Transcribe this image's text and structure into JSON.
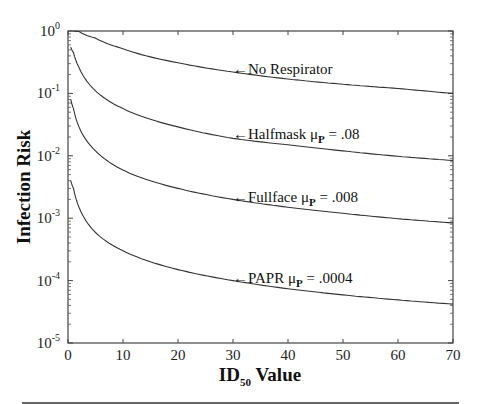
{
  "chart_data": {
    "type": "line",
    "title": "",
    "xlabel": "ID",
    "xlabel_subscript": "50",
    "xlabel_suffix": " Value",
    "ylabel": "Infection Risk",
    "xlim": [
      0,
      70
    ],
    "ylim": [
      1e-05,
      1
    ],
    "yscale": "log",
    "grid": false,
    "x_ticks": [
      0,
      10,
      20,
      30,
      40,
      50,
      60,
      70
    ],
    "y_ticks": [
      {
        "base": "10",
        "exp": "0",
        "value": 1
      },
      {
        "base": "10",
        "exp": "-1",
        "value": 0.1
      },
      {
        "base": "10",
        "exp": "-2",
        "value": 0.01
      },
      {
        "base": "10",
        "exp": "-3",
        "value": 0.001
      },
      {
        "base": "10",
        "exp": "-4",
        "value": 0.0001
      },
      {
        "base": "10",
        "exp": "-5",
        "value": 1e-05
      }
    ],
    "series": [
      {
        "name": "No Respirator",
        "annotation": {
          "prefix": "←No Respirator",
          "mu_sub": "",
          "suffix": "",
          "x": 30,
          "y": 0.25
        },
        "x": [
          1,
          2,
          5,
          10,
          20,
          30,
          40,
          50,
          60,
          70
        ],
        "values": [
          1.0,
          0.98,
          0.77,
          0.52,
          0.31,
          0.22,
          0.17,
          0.14,
          0.12,
          0.1
        ]
      },
      {
        "name": "Halfmask μP = .08",
        "annotation": {
          "prefix": "←Halfmask μ",
          "mu_sub": "P",
          "suffix": " = .08",
          "x": 30,
          "y": 0.022
        },
        "x": [
          0.5,
          1,
          2,
          5,
          10,
          20,
          30,
          40,
          50,
          60,
          70
        ],
        "values": [
          0.55,
          0.45,
          0.26,
          0.11,
          0.057,
          0.029,
          0.019,
          0.015,
          0.012,
          0.0098,
          0.0084
        ]
      },
      {
        "name": "Fullface μP = .008",
        "annotation": {
          "prefix": "←Fullface μ",
          "mu_sub": "P",
          "suffix": " = .008",
          "x": 30,
          "y": 0.0022
        },
        "x": [
          0.5,
          1,
          2,
          5,
          10,
          20,
          30,
          40,
          50,
          60,
          70
        ],
        "values": [
          0.08,
          0.057,
          0.029,
          0.012,
          0.0059,
          0.003,
          0.002,
          0.0015,
          0.0012,
          0.00098,
          0.00084
        ]
      },
      {
        "name": "PAPR μP = .0004",
        "annotation": {
          "prefix": "←PAPR μ",
          "mu_sub": "P",
          "suffix": " = .0004",
          "x": 30,
          "y": 0.00011
        },
        "x": [
          0.5,
          1,
          2,
          5,
          10,
          20,
          30,
          40,
          50,
          60,
          70
        ],
        "values": [
          0.004,
          0.003,
          0.0015,
          0.00059,
          0.0003,
          0.00015,
          0.0001,
          7.4e-05,
          5.9e-05,
          4.9e-05,
          4.2e-05
        ]
      }
    ]
  }
}
